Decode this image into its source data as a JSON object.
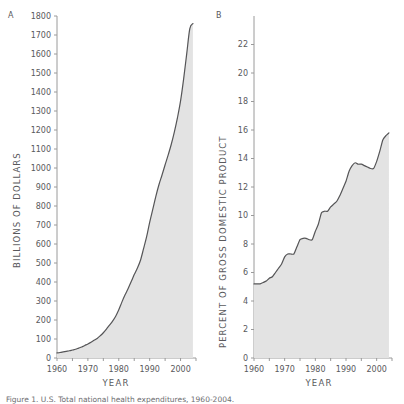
{
  "figure": {
    "caption": "Figure 1.  U.S. Total national health expenditures, 1960-2004.",
    "background": "#ffffff",
    "fill_color": "#e3e3e3",
    "line_color": "#555557",
    "axis_color": "#9a9a9a",
    "text_color": "#59595c"
  },
  "panels": [
    {
      "letter": "A",
      "ylabel": "BILLIONS OF DOLLARS",
      "xlabel": "YEAR"
    },
    {
      "letter": "B",
      "ylabel": "PERCENT OF GROSS DOMESTIC PRODUCT",
      "xlabel": "YEAR"
    }
  ],
  "chart_data": [
    {
      "type": "area",
      "panel": "A",
      "title": "",
      "xlabel": "YEAR",
      "ylabel": "BILLIONS OF DOLLARS",
      "xlim": [
        1960,
        2005
      ],
      "ylim": [
        0,
        1800
      ],
      "ytick_labels": [
        "0",
        "100",
        "200",
        "300",
        "400",
        "500",
        "600",
        "700",
        "800",
        "900",
        "1000",
        "1100",
        "1200",
        "1300",
        "1400",
        "1500",
        "1600",
        "1700",
        "1800"
      ],
      "yticks": [
        0,
        100,
        200,
        300,
        400,
        500,
        600,
        700,
        800,
        900,
        1000,
        1100,
        1200,
        1300,
        1400,
        1500,
        1600,
        1700,
        1800
      ],
      "xtick_labels": [
        "1960",
        "1970",
        "1980",
        "1990",
        "2000"
      ],
      "xticks": [
        1960,
        1965,
        1970,
        1975,
        1980,
        1985,
        1990,
        1995,
        2000,
        2005
      ],
      "xticks_labeled": [
        1960,
        1970,
        1980,
        1990,
        2000
      ],
      "grid": false,
      "legend": "none",
      "x": [
        1960,
        1961,
        1962,
        1963,
        1964,
        1965,
        1966,
        1967,
        1968,
        1969,
        1970,
        1971,
        1972,
        1973,
        1974,
        1975,
        1976,
        1977,
        1978,
        1979,
        1980,
        1981,
        1982,
        1983,
        1984,
        1985,
        1986,
        1987,
        1988,
        1989,
        1990,
        1991,
        1992,
        1993,
        1994,
        1995,
        1996,
        1997,
        1998,
        1999,
        2000,
        2001,
        2002,
        2003,
        2004
      ],
      "values": [
        27,
        29,
        32,
        35,
        38,
        42,
        46,
        52,
        58,
        66,
        74,
        83,
        93,
        103,
        117,
        133,
        152,
        173,
        194,
        220,
        254,
        294,
        331,
        365,
        401,
        439,
        472,
        513,
        574,
        637,
        714,
        782,
        851,
        912,
        963,
        1017,
        1069,
        1125,
        1190,
        1265,
        1353,
        1469,
        1602,
        1733,
        1760
      ]
    },
    {
      "type": "area",
      "panel": "B",
      "title": "",
      "xlabel": "YEAR",
      "ylabel": "PERCENT OF GROSS DOMESTIC PRODUCT",
      "xlim": [
        1960,
        2005
      ],
      "ylim": [
        0,
        24
      ],
      "ytick_labels": [
        "0",
        "2",
        "4",
        "6",
        "8",
        "10",
        "12",
        "14",
        "16",
        "18",
        "20",
        "22"
      ],
      "yticks": [
        0,
        2,
        4,
        6,
        8,
        10,
        12,
        14,
        16,
        18,
        20,
        22
      ],
      "xtick_labels": [
        "1960",
        "1970",
        "1980",
        "1990",
        "2000"
      ],
      "xticks": [
        1960,
        1965,
        1970,
        1975,
        1980,
        1985,
        1990,
        1995,
        2000,
        2005
      ],
      "xticks_labeled": [
        1960,
        1970,
        1980,
        1990,
        2000
      ],
      "grid": false,
      "legend": "none",
      "x": [
        1960,
        1961,
        1962,
        1963,
        1964,
        1965,
        1966,
        1967,
        1968,
        1969,
        1970,
        1971,
        1972,
        1973,
        1974,
        1975,
        1976,
        1977,
        1978,
        1979,
        1980,
        1981,
        1982,
        1983,
        1984,
        1985,
        1986,
        1987,
        1988,
        1989,
        1990,
        1991,
        1992,
        1993,
        1994,
        1995,
        1996,
        1997,
        1998,
        1999,
        2000,
        2001,
        2002,
        2003,
        2004
      ],
      "values": [
        5.2,
        5.2,
        5.2,
        5.3,
        5.4,
        5.6,
        5.7,
        6.0,
        6.3,
        6.6,
        7.1,
        7.3,
        7.3,
        7.3,
        7.8,
        8.3,
        8.4,
        8.4,
        8.3,
        8.3,
        8.9,
        9.4,
        10.2,
        10.3,
        10.3,
        10.6,
        10.8,
        11.0,
        11.4,
        11.9,
        12.4,
        13.1,
        13.5,
        13.7,
        13.6,
        13.6,
        13.5,
        13.4,
        13.3,
        13.3,
        13.8,
        14.5,
        15.3,
        15.6,
        15.8
      ]
    }
  ]
}
